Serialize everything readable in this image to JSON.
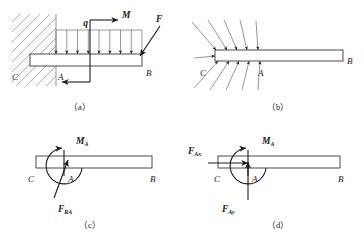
{
  "figure": {
    "panels": [
      {
        "id": "a",
        "caption": "（a）",
        "description": "Cantilever beam CB fixed in a wall with distributed load q, couple M and inclined force F",
        "labels": {
          "point_c": "C",
          "point_a": "A",
          "point_b": "B",
          "load_q": "q",
          "moment_m": "M",
          "force_f": "F"
        },
        "distributed_load_arrow_count": 9
      },
      {
        "id": "b",
        "caption": "（b）",
        "description": "Beam removed from wall showing distributed contact reactions at the built-in end",
        "labels": {
          "point_c": "C",
          "point_a": "A",
          "point_b": "B"
        },
        "reaction_arrow_count_top": 5,
        "reaction_arrow_count_bottom": 5
      },
      {
        "id": "c",
        "caption": "（c）",
        "description": "Equivalent reaction resultant force F_RA and reaction couple M_A at section A",
        "labels": {
          "point_c": "C",
          "point_a": "A",
          "point_b": "B",
          "moment_ma": "M",
          "moment_ma_sub": "A",
          "force_fra": "F",
          "force_fra_sub": "RA"
        }
      },
      {
        "id": "d",
        "caption": "（d）",
        "description": "Reaction resolved into components F_Ax and F_Ay with couple M_A at section A",
        "labels": {
          "point_c": "C",
          "point_a": "A",
          "point_b": "B",
          "moment_ma": "M",
          "moment_ma_sub": "A",
          "force_fax": "F",
          "force_fax_sub": "Ax",
          "force_fay": "F",
          "force_fay_sub": "Ay"
        }
      }
    ],
    "colors": {
      "line": "#3a3a3a",
      "thin_line": "#6a6a6a",
      "hatch": "#9a9a9a",
      "text": "#1a1a1a",
      "background": "#ffffff"
    }
  }
}
